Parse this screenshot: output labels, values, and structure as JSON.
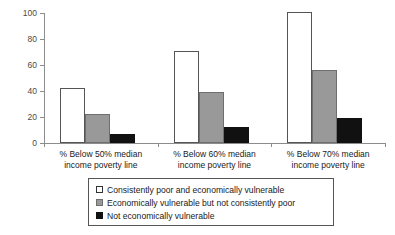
{
  "chart_data": {
    "type": "bar",
    "title": "",
    "xlabel": "",
    "ylabel": "",
    "ylim": [
      0,
      100
    ],
    "yticks": [
      0,
      20,
      40,
      60,
      80,
      100
    ],
    "grid": false,
    "legend_position": "bottom",
    "categories": [
      "% Below 50% median income poverty line",
      "% Below 60% median income poverty line",
      "% Below 70% median income poverty line"
    ],
    "category_lines": [
      [
        "% Below 50% median",
        "income poverty line"
      ],
      [
        "% Below 60% median",
        "income poverty line"
      ],
      [
        "% Below 70% median",
        "income poverty line"
      ]
    ],
    "series": [
      {
        "name": "Consistently poor and economically vulnerable",
        "color": "#ffffff",
        "values": [
          42,
          71,
          101
        ]
      },
      {
        "name": "Economically vulnerable but not consistently poor",
        "color": "#999999",
        "values": [
          22,
          39,
          56
        ]
      },
      {
        "name": "Not economically vulnerable",
        "color": "#111111",
        "values": [
          7,
          12,
          19
        ]
      }
    ]
  },
  "legend": {
    "items": [
      "Consistently poor and economically vulnerable",
      "Economically vulnerable but not consistently poor",
      "Not economically vulnerable"
    ]
  },
  "axis": {
    "y_tick_labels": [
      "0",
      "20",
      "40",
      "60",
      "80",
      "100"
    ]
  }
}
